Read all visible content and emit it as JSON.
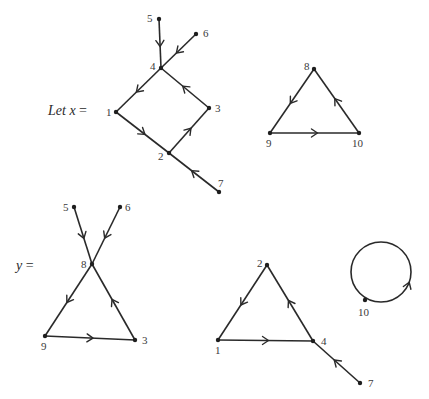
{
  "captions": {
    "x": {
      "var": "Let x",
      "eq": " =",
      "pos": [
        48,
        115
      ]
    },
    "y": {
      "var": "y",
      "eq": " =",
      "pos": [
        16,
        270
      ]
    }
  },
  "graphs": [
    {
      "id": "x-graph-a",
      "nodes": [
        {
          "id": "1",
          "x": 116,
          "y": 112,
          "lx": 106,
          "ly": 116
        },
        {
          "id": "2",
          "x": 169,
          "y": 153,
          "lx": 158,
          "ly": 160
        },
        {
          "id": "3",
          "x": 209,
          "y": 108,
          "lx": 215,
          "ly": 112
        },
        {
          "id": "4",
          "x": 161,
          "y": 68,
          "lx": 150,
          "ly": 70
        },
        {
          "id": "5",
          "x": 159,
          "y": 19,
          "lx": 147,
          "ly": 22
        },
        {
          "id": "6",
          "x": 196,
          "y": 34,
          "lx": 203,
          "ly": 37
        },
        {
          "id": "7",
          "x": 219,
          "y": 192,
          "lx": 218,
          "ly": 187
        }
      ],
      "edges": [
        {
          "from": "5",
          "to": "4"
        },
        {
          "from": "6",
          "to": "4"
        },
        {
          "from": "4",
          "to": "1"
        },
        {
          "from": "1",
          "to": "2"
        },
        {
          "from": "2",
          "to": "3"
        },
        {
          "from": "3",
          "to": "4"
        },
        {
          "from": "7",
          "to": "2"
        }
      ]
    },
    {
      "id": "x-graph-b",
      "nodes": [
        {
          "id": "8",
          "x": 314,
          "y": 69,
          "lx": 304,
          "ly": 70
        },
        {
          "id": "9",
          "x": 270,
          "y": 133,
          "lx": 266,
          "ly": 147
        },
        {
          "id": "10",
          "x": 359,
          "y": 133,
          "lx": 352,
          "ly": 147
        }
      ],
      "edges": [
        {
          "from": "8",
          "to": "9"
        },
        {
          "from": "9",
          "to": "10"
        },
        {
          "from": "10",
          "to": "8"
        }
      ]
    },
    {
      "id": "y-graph-a",
      "nodes": [
        {
          "id": "5",
          "x": 74,
          "y": 207,
          "lx": 63,
          "ly": 211
        },
        {
          "id": "6",
          "x": 120,
          "y": 207,
          "lx": 125,
          "ly": 211
        },
        {
          "id": "8",
          "x": 92,
          "y": 264,
          "lx": 81,
          "ly": 268
        },
        {
          "id": "9",
          "x": 45,
          "y": 336,
          "lx": 41,
          "ly": 350
        },
        {
          "id": "3",
          "x": 135,
          "y": 340,
          "lx": 142,
          "ly": 344
        }
      ],
      "edges": [
        {
          "from": "5",
          "to": "8"
        },
        {
          "from": "6",
          "to": "8"
        },
        {
          "from": "8",
          "to": "9"
        },
        {
          "from": "9",
          "to": "3"
        },
        {
          "from": "3",
          "to": "8"
        }
      ]
    },
    {
      "id": "y-graph-b",
      "nodes": [
        {
          "id": "2",
          "x": 267,
          "y": 265,
          "lx": 257,
          "ly": 267
        },
        {
          "id": "1",
          "x": 218,
          "y": 340,
          "lx": 215,
          "ly": 354
        },
        {
          "id": "4",
          "x": 313,
          "y": 341,
          "lx": 321,
          "ly": 345
        },
        {
          "id": "7",
          "x": 360,
          "y": 383,
          "lx": 368,
          "ly": 387
        }
      ],
      "edges": [
        {
          "from": "2",
          "to": "1"
        },
        {
          "from": "1",
          "to": "4"
        },
        {
          "from": "4",
          "to": "2"
        },
        {
          "from": "7",
          "to": "4"
        }
      ]
    }
  ],
  "loop": {
    "id": "y-loop-10",
    "cx": 381,
    "cy": 272,
    "r": 30,
    "node": {
      "id": "10",
      "x": 365,
      "y": 300,
      "lx": 358,
      "ly": 316
    },
    "arrow_angle_deg": 20
  }
}
